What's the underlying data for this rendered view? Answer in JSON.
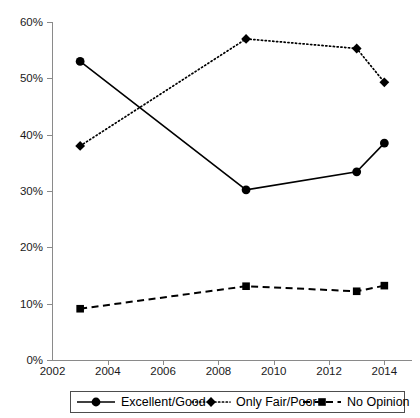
{
  "chart_data": {
    "type": "line",
    "title": "",
    "xlabel": "",
    "ylabel": "",
    "xlim": [
      2002,
      2015
    ],
    "ylim": [
      0,
      60
    ],
    "grid": false,
    "legend_position": "bottom",
    "x": [
      2003,
      2009,
      2013,
      2014
    ],
    "x_ticks": [
      "2002",
      "2004",
      "2006",
      "2008",
      "2010",
      "2012",
      "2014"
    ],
    "x_tick_values": [
      2002,
      2004,
      2006,
      2008,
      2010,
      2012,
      2014
    ],
    "y_ticks": [
      "0%",
      "10%",
      "20%",
      "30%",
      "40%",
      "50%",
      "60%"
    ],
    "y_tick_values": [
      0,
      10,
      20,
      30,
      40,
      50,
      60
    ],
    "series": [
      {
        "name": "Excellent/Good",
        "values": [
          53.0,
          30.2,
          33.4,
          38.5
        ],
        "line_style": "solid",
        "marker": "circle",
        "color": "#000000"
      },
      {
        "name": "Only Fair/Poor",
        "values": [
          38.0,
          57.0,
          55.3,
          49.3
        ],
        "line_style": "dotted",
        "marker": "diamond",
        "color": "#000000"
      },
      {
        "name": "No Opinion",
        "values": [
          9.1,
          13.1,
          12.2,
          13.2
        ],
        "line_style": "dashed",
        "marker": "square",
        "color": "#000000"
      }
    ]
  },
  "legend": {
    "items": [
      {
        "label": "Excellent/Good"
      },
      {
        "label": "Only Fair/Poor"
      },
      {
        "label": "No Opinion"
      }
    ]
  }
}
